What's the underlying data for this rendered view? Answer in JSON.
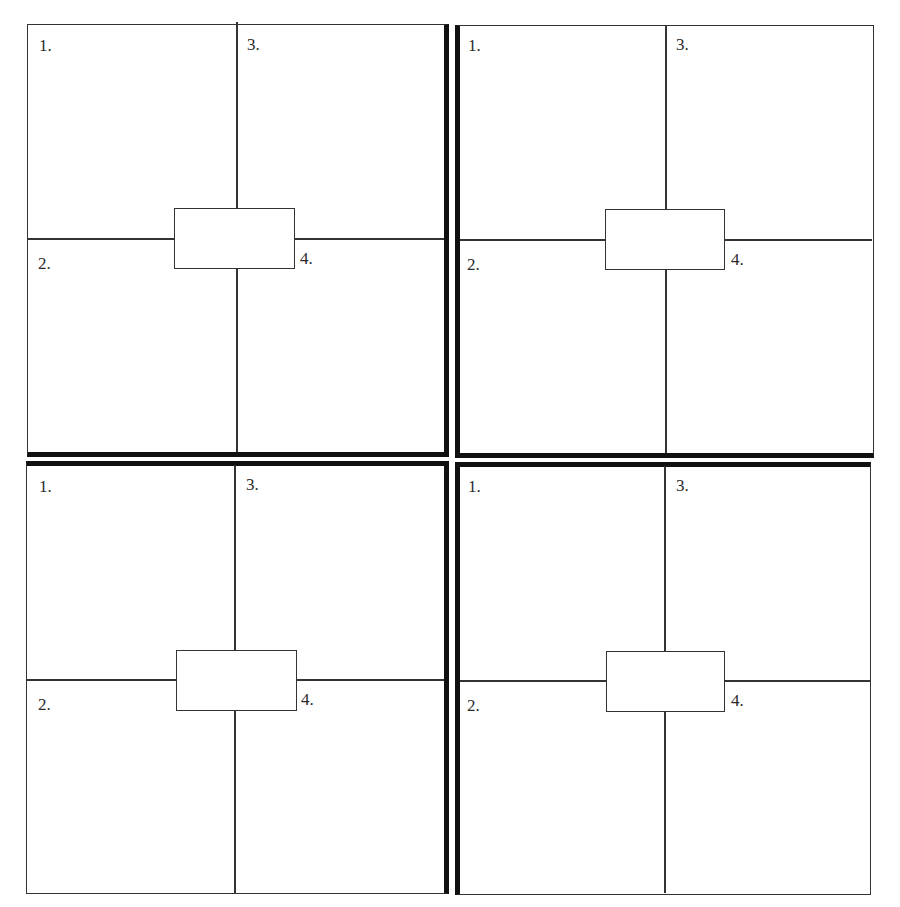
{
  "worksheet": {
    "panels": [
      {
        "labels": [
          "1.",
          "2.",
          "3.",
          "4."
        ],
        "center_box_text": ""
      },
      {
        "labels": [
          "1.",
          "2.",
          "3.",
          "4."
        ],
        "center_box_text": ""
      },
      {
        "labels": [
          "1.",
          "2.",
          "3.",
          "4."
        ],
        "center_box_text": ""
      },
      {
        "labels": [
          "1.",
          "2.",
          "3.",
          "4."
        ],
        "center_box_text": ""
      }
    ]
  }
}
